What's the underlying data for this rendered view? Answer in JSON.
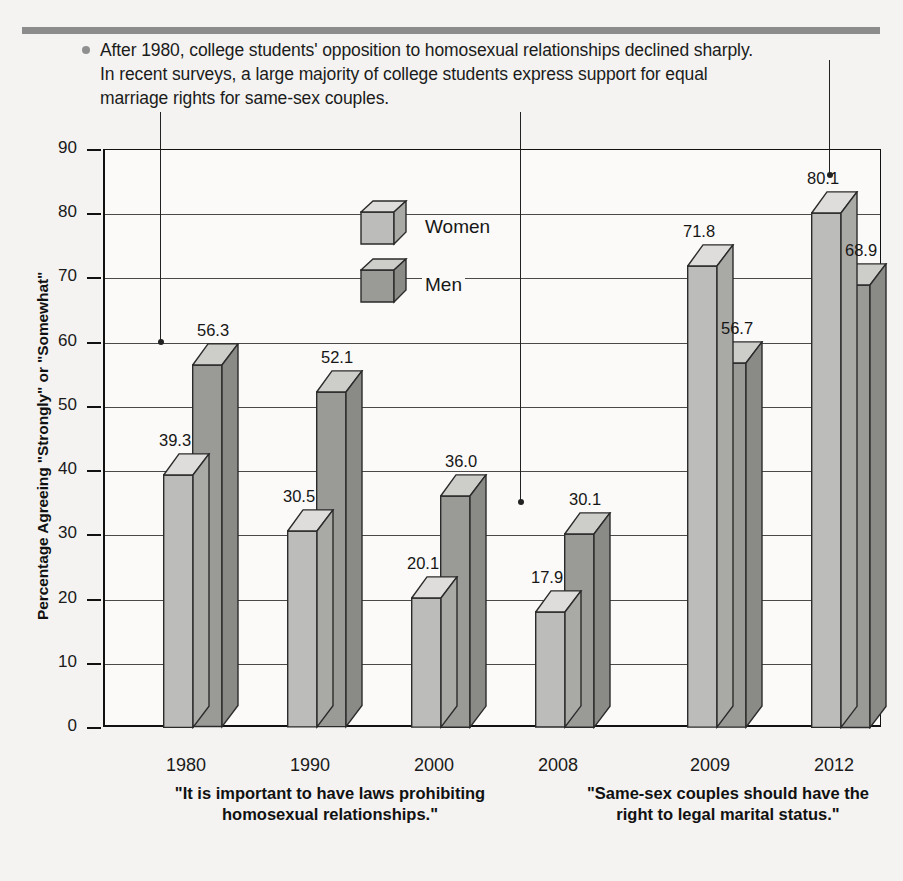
{
  "caption": {
    "text": "After 1980, college students' opposition to homosexual relationships declined sharply. In recent surveys, a large majority of college students express support for equal marriage rights for same-sex couples.",
    "bullet": "bullet-dot"
  },
  "legend": {
    "items": [
      {
        "label": "Women",
        "color": "#b9b9b7"
      },
      {
        "label": "Men",
        "color": "#969693"
      }
    ]
  },
  "group_captions": [
    "\"It is important to have laws\nprohibiting homosexual relationships.\"",
    "\"Same-sex couples should\nhave the right to legal\nmarital status.\""
  ],
  "chart_data": {
    "type": "bar",
    "title": "",
    "xlabel": "",
    "ylabel": "Percentage Agreeing \"Strongly\" or \"Somewhat\"",
    "ylim": [
      0,
      90
    ],
    "yticks": [
      0,
      10,
      20,
      30,
      40,
      50,
      60,
      70,
      80,
      90
    ],
    "grid": true,
    "legend_position": "inside-top-center",
    "categories": [
      "1980",
      "1990",
      "2000",
      "2008",
      "2009",
      "2012"
    ],
    "series": [
      {
        "name": "Women",
        "values": [
          39.3,
          30.5,
          20.1,
          17.9,
          71.8,
          80.1
        ],
        "color": "#b9b9b7"
      },
      {
        "name": "Men",
        "values": [
          56.3,
          52.1,
          36.0,
          30.1,
          56.7,
          68.9
        ],
        "color": "#969693"
      }
    ],
    "group_sets": [
      {
        "caption": "\"It is important to have laws prohibiting homosexual relationships.\"",
        "categories": [
          "1980",
          "1990",
          "2000",
          "2008"
        ]
      },
      {
        "caption": "\"Same-sex couples should have the right to legal marital status.\"",
        "categories": [
          "2009",
          "2012"
        ]
      }
    ],
    "data_labels": [
      "39.3",
      "56.3",
      "30.5",
      "52.1",
      "20.1",
      "36.0",
      "17.9",
      "30.1",
      "71.8",
      "56.7",
      "80.1",
      "68.9"
    ],
    "annotations": [
      {
        "name": "leader-line-1",
        "target_value": 60
      },
      {
        "name": "leader-line-2",
        "target_value": 35
      },
      {
        "name": "leader-line-3",
        "target_value": 86
      }
    ]
  }
}
